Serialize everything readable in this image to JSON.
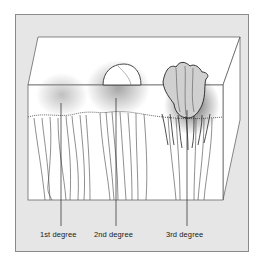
{
  "figure": {
    "type": "skin cross-section diagram",
    "labels": [
      {
        "id": "first",
        "text": "1st degree",
        "x": 40
      },
      {
        "id": "second",
        "text": "2nd degree",
        "x": 94
      },
      {
        "id": "third",
        "text": "3rd degree",
        "x": 166
      }
    ],
    "colors": {
      "panel": "#e6e6e6",
      "panel_border": "#8a8a8a",
      "skin": "#ffffff",
      "ink": "#333333",
      "shading": "#9a9a9a"
    }
  }
}
